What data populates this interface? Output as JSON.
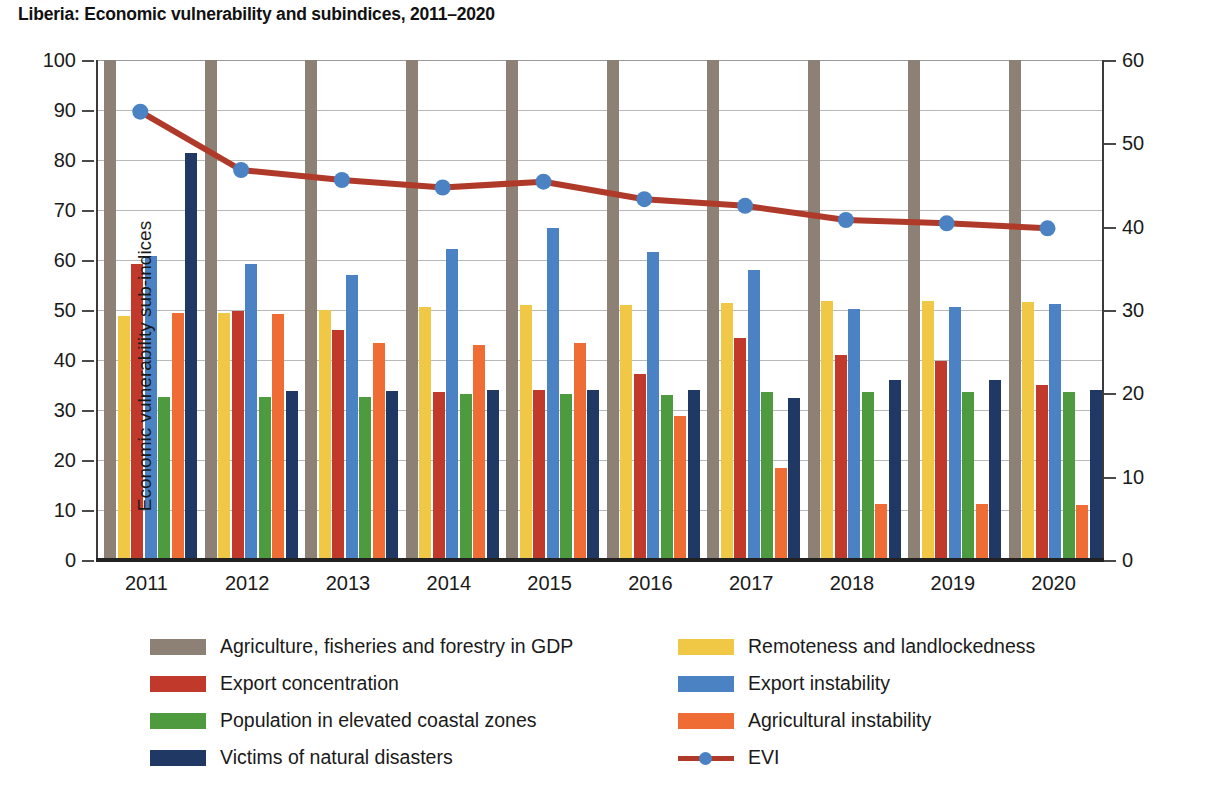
{
  "chart_data": {
    "type": "bar",
    "title": "Liberia: Economic vulnerability and subindices, 2011–2020",
    "xlabel": "",
    "ylabel": "Economic vulnerability sub-indices",
    "ylabel_secondary": "Economic vulnerability index",
    "ylim": [
      0,
      100
    ],
    "ylim_secondary": [
      0,
      60
    ],
    "yticks": [
      "0",
      "10",
      "20",
      "30",
      "40",
      "50",
      "60",
      "70",
      "80",
      "90",
      "100"
    ],
    "yticks_secondary": [
      "0",
      "10",
      "20",
      "30",
      "40",
      "50",
      "60"
    ],
    "grid": true,
    "legend_position": "bottom",
    "categories": [
      "2011",
      "2012",
      "2013",
      "2014",
      "2015",
      "2016",
      "2017",
      "2018",
      "2019",
      "2020"
    ],
    "series": [
      {
        "name": "Agriculture, fisheries and forestry in GDP",
        "color": "#8c8174",
        "axis": "left",
        "values": [
          100,
          100,
          100,
          100,
          100,
          100,
          100,
          100,
          100,
          100
        ]
      },
      {
        "name": "Remoteness and landlockedness",
        "color": "#f0c846",
        "axis": "left",
        "values": [
          48.9,
          49.5,
          50.1,
          50.7,
          51.1,
          51.1,
          51.5,
          51.8,
          51.8,
          51.7
        ]
      },
      {
        "name": "Export concentration",
        "color": "#c0392b",
        "axis": "left",
        "values": [
          59.3,
          49.9,
          46.1,
          33.6,
          34.1,
          37.3,
          44.4,
          41.1,
          39.8,
          35.1
        ]
      },
      {
        "name": "Export instability",
        "color": "#4a82c4",
        "axis": "left",
        "values": [
          60.9,
          59.3,
          57.1,
          62.2,
          66.5,
          61.7,
          58.1,
          50.3,
          50.7,
          51.3
        ]
      },
      {
        "name": "Population in elevated coastal zones",
        "color": "#4e9a3f",
        "axis": "left",
        "values": [
          32.6,
          32.6,
          32.6,
          33.2,
          33.2,
          33.1,
          33.6,
          33.7,
          33.7,
          33.7
        ]
      },
      {
        "name": "Agricultural instability",
        "color": "#f06c35",
        "axis": "left",
        "values": [
          49.4,
          49.3,
          43.4,
          43.0,
          43.5,
          28.8,
          18.4,
          11.2,
          11.2,
          11.1
        ]
      },
      {
        "name": "Victims of natural disasters",
        "color": "#1f3864",
        "axis": "left",
        "values": [
          81.4,
          33.9,
          33.9,
          34.0,
          34.0,
          34.0,
          32.5,
          36.0,
          36.0,
          34.0
        ]
      }
    ],
    "line_series": {
      "name": "EVI",
      "axis": "right",
      "line_color": "#b03a2a",
      "marker_color": "#4a82c4",
      "values": [
        53.8,
        46.8,
        45.6,
        44.7,
        45.4,
        43.3,
        42.5,
        40.8,
        40.4,
        39.8
      ]
    }
  },
  "legend": {
    "left_column": [
      {
        "label": "Agriculture, fisheries and forestry in GDP",
        "color": "#8c8174",
        "icon": "swatch-icon"
      },
      {
        "label": "Export concentration",
        "color": "#c0392b",
        "icon": "swatch-icon"
      },
      {
        "label": "Population in elevated coastal zones",
        "color": "#4e9a3f",
        "icon": "swatch-icon"
      },
      {
        "label": "Victims of natural disasters",
        "color": "#1f3864",
        "icon": "swatch-icon"
      }
    ],
    "right_column": [
      {
        "label": "Remoteness and landlockedness",
        "color": "#f0c846",
        "icon": "swatch-icon"
      },
      {
        "label": "Export instability",
        "color": "#4a82c4",
        "icon": "swatch-icon"
      },
      {
        "label": "Agricultural instability",
        "color": "#f06c35",
        "icon": "swatch-icon"
      },
      {
        "label": "EVI",
        "color": "#b03a2a",
        "icon": "line-marker-icon"
      }
    ]
  }
}
